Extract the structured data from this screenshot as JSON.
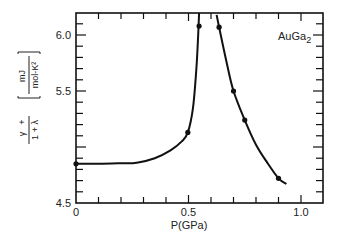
{
  "chart_data": {
    "type": "line",
    "title": "",
    "annotation": "AuGa",
    "annotation_subscript": "2",
    "xlabel": "P(GPa)",
    "ylabel": {
      "numerator": "γ",
      "plus": "+",
      "denominator": "1 + λ",
      "unit_numerator": "mJ",
      "unit_denominator": "mol-K²"
    },
    "xlim": [
      0,
      1.1
    ],
    "ylim": [
      4.5,
      6.2
    ],
    "xticks": [
      0,
      0.5,
      1.0
    ],
    "xtick_labels": [
      "0",
      "0.5",
      "1.0"
    ],
    "yticks": [
      4.5,
      5.5,
      6.0
    ],
    "ytick_labels": [
      "4.5",
      "5.5",
      "6.0"
    ],
    "x_minor_step": 0.1,
    "y_minor_step": 0.1,
    "grid": false,
    "legend": null,
    "series": [
      {
        "name": "low-pressure branch",
        "points": [
          [
            0.0,
            4.85
          ],
          [
            0.497,
            5.13
          ],
          [
            0.547,
            6.08
          ]
        ],
        "curve": [
          [
            0.0,
            4.85
          ],
          [
            0.1,
            4.85
          ],
          [
            0.2,
            4.855
          ],
          [
            0.27,
            4.86
          ],
          [
            0.35,
            4.9
          ],
          [
            0.42,
            4.97
          ],
          [
            0.47,
            5.05
          ],
          [
            0.497,
            5.13
          ],
          [
            0.52,
            5.35
          ],
          [
            0.535,
            5.7
          ],
          [
            0.543,
            6.0
          ],
          [
            0.547,
            6.2
          ]
        ]
      },
      {
        "name": "high-pressure branch",
        "points": [
          [
            0.636,
            6.07
          ],
          [
            0.7,
            5.5
          ],
          [
            0.75,
            5.24
          ],
          [
            0.9,
            4.72
          ]
        ],
        "curve": [
          [
            0.625,
            6.18
          ],
          [
            0.636,
            6.07
          ],
          [
            0.67,
            5.75
          ],
          [
            0.7,
            5.5
          ],
          [
            0.75,
            5.24
          ],
          [
            0.8,
            5.02
          ],
          [
            0.85,
            4.86
          ],
          [
            0.9,
            4.72
          ],
          [
            0.935,
            4.67
          ]
        ]
      }
    ]
  }
}
